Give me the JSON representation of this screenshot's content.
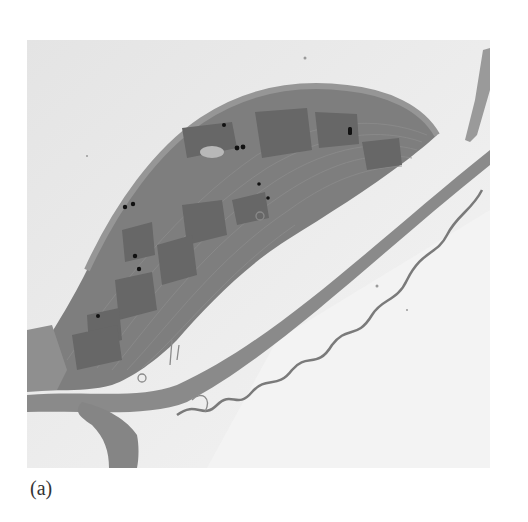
{
  "figure": {
    "panel_label": "(a)",
    "image_subject": "electron-micrograph-chloroplast",
    "colors": {
      "background": "#e9e9e9",
      "chloroplast": "#7d7d7d",
      "grana": "#666666",
      "cell_wall": "#8a8a8a",
      "plastoglobuli": "#111111"
    }
  }
}
